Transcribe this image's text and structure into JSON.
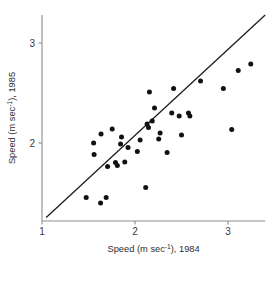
{
  "chart_data": {
    "type": "scatter",
    "title": "",
    "xlabel": "Speed (m sec⁻¹), 1984",
    "ylabel": "Speed (m sec⁻¹), 1985",
    "xlabel_parts": {
      "pre": "Speed (m sec",
      "sup": "-1",
      "post": "), 1984"
    },
    "ylabel_parts": {
      "pre": "Speed (m sec",
      "sup": "-1",
      "post": "), 1985"
    },
    "xlim": [
      1.0,
      3.4
    ],
    "ylim": [
      1.22,
      3.28
    ],
    "xticks": [
      1,
      2,
      3
    ],
    "xtick_labels": [
      "1",
      "2",
      "3"
    ],
    "yticks": [
      2,
      3
    ],
    "ytick_labels": [
      "2",
      "3"
    ],
    "grid": false,
    "legend": "none",
    "point_color": "#111111",
    "point_radius": 2.5,
    "line_color": "#1a1a1a",
    "axis_color": "#8c8c8c",
    "reference_line": {
      "label": "1:1 line",
      "x1": 1.045,
      "y1": 1.255,
      "x2": 3.4,
      "y2": 3.28
    },
    "points": [
      {
        "x": 1.475,
        "y": 1.455
      },
      {
        "x": 1.555,
        "y": 2.0
      },
      {
        "x": 1.56,
        "y": 1.885
      },
      {
        "x": 1.63,
        "y": 1.4
      },
      {
        "x": 1.635,
        "y": 2.09
      },
      {
        "x": 1.69,
        "y": 1.455
      },
      {
        "x": 1.705,
        "y": 1.765
      },
      {
        "x": 1.755,
        "y": 2.14
      },
      {
        "x": 1.79,
        "y": 1.805
      },
      {
        "x": 1.81,
        "y": 1.775
      },
      {
        "x": 1.845,
        "y": 1.99
      },
      {
        "x": 1.855,
        "y": 2.06
      },
      {
        "x": 1.89,
        "y": 1.81
      },
      {
        "x": 1.925,
        "y": 1.955
      },
      {
        "x": 2.025,
        "y": 1.915
      },
      {
        "x": 2.055,
        "y": 2.03
      },
      {
        "x": 2.115,
        "y": 1.555
      },
      {
        "x": 2.13,
        "y": 2.19
      },
      {
        "x": 2.145,
        "y": 2.155
      },
      {
        "x": 2.155,
        "y": 2.51
      },
      {
        "x": 2.185,
        "y": 2.22
      },
      {
        "x": 2.21,
        "y": 2.35
      },
      {
        "x": 2.255,
        "y": 2.04
      },
      {
        "x": 2.27,
        "y": 2.1
      },
      {
        "x": 2.345,
        "y": 1.905
      },
      {
        "x": 2.395,
        "y": 2.3
      },
      {
        "x": 2.415,
        "y": 2.545
      },
      {
        "x": 2.475,
        "y": 2.27
      },
      {
        "x": 2.5,
        "y": 2.08
      },
      {
        "x": 2.575,
        "y": 2.3
      },
      {
        "x": 2.59,
        "y": 2.27
      },
      {
        "x": 2.705,
        "y": 2.62
      },
      {
        "x": 2.95,
        "y": 2.545
      },
      {
        "x": 3.04,
        "y": 2.135
      },
      {
        "x": 3.11,
        "y": 2.725
      },
      {
        "x": 3.245,
        "y": 2.79
      }
    ]
  }
}
